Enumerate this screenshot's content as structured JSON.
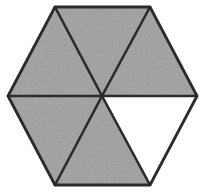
{
  "figure": {
    "shape_name": "hexagon",
    "total_sectors": 6,
    "shaded_sectors": 5,
    "unshaded_sectors": 1,
    "fraction_shaded": "5/6",
    "fraction_unshaded": "1/6",
    "background_color": "#ffffff",
    "shaded_fill_color": "#a9a9a9",
    "unshaded_fill_color": "#ffffff",
    "line_color": "#2b2b2b",
    "line_width": 2.6,
    "center": {
      "x": 102,
      "y": 96
    },
    "vertices": [
      {
        "name": "top-left",
        "x": 55,
        "y": 7
      },
      {
        "name": "top-right",
        "x": 150,
        "y": 7
      },
      {
        "name": "right",
        "x": 197,
        "y": 96
      },
      {
        "name": "bottom-right",
        "x": 150,
        "y": 185
      },
      {
        "name": "bottom-left",
        "x": 55,
        "y": 185
      },
      {
        "name": "left",
        "x": 8,
        "y": 96
      }
    ],
    "sectors": [
      {
        "name": "sector-top",
        "position": "top",
        "shaded": true,
        "points": "102,96 55,7 150,7"
      },
      {
        "name": "sector-upper-right",
        "position": "upper-right",
        "shaded": true,
        "points": "102,96 150,7 197,96"
      },
      {
        "name": "sector-lower-right",
        "position": "lower-right",
        "shaded": false,
        "points": "102,96 197,96 150,185"
      },
      {
        "name": "sector-bottom",
        "position": "bottom",
        "shaded": true,
        "points": "102,96 150,185 55,185"
      },
      {
        "name": "sector-lower-left",
        "position": "lower-left",
        "shaded": true,
        "points": "102,96 55,185 8,96"
      },
      {
        "name": "sector-upper-left",
        "position": "upper-left",
        "shaded": true,
        "points": "102,96 8,96 55,7"
      }
    ],
    "outline_points": "55,7 150,7 197,96 150,185 55,185 8,96",
    "spokes": [
      {
        "name": "spoke-to-top-left",
        "x1": 102,
        "y1": 96,
        "x2": 55,
        "y2": 7
      },
      {
        "name": "spoke-to-top-right",
        "x1": 102,
        "y1": 96,
        "x2": 150,
        "y2": 7
      },
      {
        "name": "spoke-to-right",
        "x1": 102,
        "y1": 96,
        "x2": 197,
        "y2": 96
      },
      {
        "name": "spoke-to-bottom-right",
        "x1": 102,
        "y1": 96,
        "x2": 150,
        "y2": 185
      },
      {
        "name": "spoke-to-bottom-left",
        "x1": 102,
        "y1": 96,
        "x2": 55,
        "y2": 185
      },
      {
        "name": "spoke-to-left",
        "x1": 102,
        "y1": 96,
        "x2": 8,
        "y2": 96
      }
    ]
  }
}
